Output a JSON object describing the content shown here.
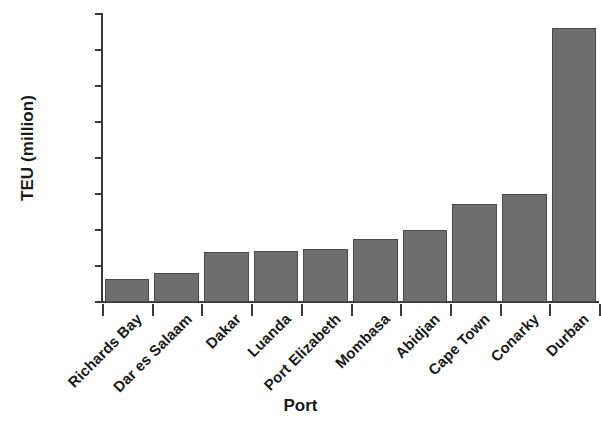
{
  "chart_data": {
    "type": "bar",
    "title": "",
    "xlabel": "Port",
    "ylabel": "TEU (million)",
    "categories": [
      "Richards Bay",
      "Dar es Salaam",
      "Dakar",
      "Luanda",
      "Port Elizabeth",
      "Mombasa",
      "Abidjan",
      "Cape Town",
      "Conarky",
      "Durban"
    ],
    "values": [
      0.16,
      0.2,
      0.35,
      0.355,
      0.37,
      0.44,
      0.5,
      0.68,
      0.75,
      1.9
    ],
    "ylim": [
      0,
      2.0
    ],
    "ytick_values": [
      0,
      0.25,
      0.5,
      0.75,
      1.0,
      1.25,
      1.5,
      1.75,
      2.0
    ],
    "ytick_labels": [
      "0",
      "0.25",
      "0.50",
      "0.75",
      "1.00",
      "1.25",
      "1.50",
      "1.75",
      "2.00"
    ],
    "grid": false,
    "legend": null,
    "bar_color": "#6e6e6e",
    "bar_edge_color": "#4a4a4a",
    "axis_color": "#3a3a3a"
  }
}
